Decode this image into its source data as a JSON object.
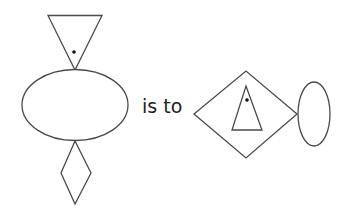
{
  "diagram": {
    "type": "figure-analogy",
    "connector_text": "is to",
    "colors": {
      "stroke": "#4a4a4a",
      "fill": "#ffffff",
      "dot": "#111111",
      "text": "#222222"
    },
    "left_figure": {
      "description": "Inverted triangle with a dot on top of a horizontal ellipse, with a vertical diamond hanging below",
      "parts": [
        {
          "shape": "inverted-triangle",
          "contains_dot": true,
          "position": "top"
        },
        {
          "shape": "horizontal-ellipse",
          "contains_dot": false,
          "position": "center"
        },
        {
          "shape": "vertical-diamond",
          "contains_dot": false,
          "position": "bottom"
        }
      ]
    },
    "right_figure": {
      "description": "Horizontal diamond containing an upright triangle with a dot, attached to a vertical ellipse on the right",
      "parts": [
        {
          "shape": "horizontal-diamond",
          "contains": "upright-triangle-with-dot",
          "position": "left"
        },
        {
          "shape": "upright-triangle",
          "contains_dot": true,
          "position": "inside-diamond"
        },
        {
          "shape": "vertical-ellipse",
          "contains_dot": false,
          "position": "right"
        }
      ]
    }
  }
}
